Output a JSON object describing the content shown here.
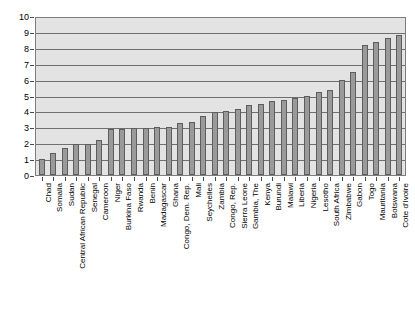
{
  "chart_data": {
    "type": "bar",
    "title": "",
    "subtitle": "",
    "xlabel": "",
    "ylabel": "",
    "ylim": [
      0,
      10
    ],
    "y_ticks": [
      0,
      1,
      2,
      3,
      4,
      5,
      6,
      7,
      8,
      9,
      10
    ],
    "grid": true,
    "legend": false,
    "legend_position": "none",
    "bar_color": "#9a9a9a",
    "bar_border_color": "#5d5d5d",
    "plot_background": "#e3e3e3",
    "categories": [
      "Chad",
      "Somalia",
      "Sudan",
      "Central African Republic",
      "Senegal",
      "Cameroon",
      "Niger",
      "Burkina Faso",
      "Rwanda",
      "Benin",
      "Madagascar",
      "Ghana",
      "Congo, Dem. Rep.",
      "Mali",
      "Seychelles",
      "Zambia",
      "Congo, Rep.",
      "Sierra Leone",
      "Gambia, The",
      "Kenya",
      "Burundi",
      "Malawi",
      "Liberia",
      "Nigeria",
      "Lesotho",
      "South Africa",
      "Zimbabwe",
      "Gabon",
      "Togo",
      "Mauritania",
      "Botswana",
      "Cote d'Ivoire"
    ],
    "values": [
      1.05,
      1.4,
      1.7,
      1.95,
      2.0,
      2.2,
      2.9,
      2.95,
      3.0,
      3.0,
      3.05,
      3.05,
      3.3,
      3.35,
      3.75,
      4.0,
      4.05,
      4.2,
      4.45,
      4.5,
      4.7,
      4.8,
      4.9,
      5.05,
      5.3,
      5.4,
      6.05,
      6.55,
      8.3,
      8.5,
      8.7,
      8.9
    ]
  }
}
